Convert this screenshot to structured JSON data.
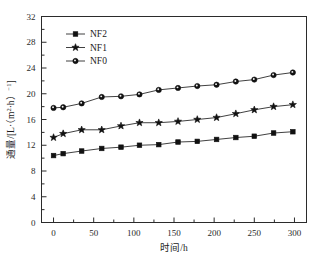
{
  "chart_data": {
    "type": "line",
    "title": "",
    "xlabel": "时间/h",
    "ylabel": "通量/[L·（m²·h）⁻¹]",
    "ylabel_parts": {
      "main": "通量",
      "slash": "/[L·（m",
      "sup1": "2",
      "mid": "·h）",
      "sup2": "−1",
      "end": "]"
    },
    "xlim": [
      -15,
      315
    ],
    "ylim": [
      0,
      32
    ],
    "xticks": [
      0,
      50,
      100,
      150,
      200,
      250,
      300
    ],
    "yticks": [
      0,
      4,
      8,
      12,
      16,
      20,
      24,
      28,
      32
    ],
    "xtick_labels": [
      "0",
      "50",
      "100",
      "150",
      "200",
      "250",
      "300"
    ],
    "ytick_labels": [
      "0",
      "4",
      "8",
      "12",
      "16",
      "20",
      "24",
      "28",
      "32"
    ],
    "minor_yticks": [
      2,
      6,
      10,
      14,
      18,
      22,
      26,
      30
    ],
    "grid": false,
    "legend_position": "upper-left-inside",
    "x": [
      0,
      12,
      35,
      60,
      84,
      107,
      131,
      155,
      179,
      203,
      227,
      250,
      274,
      298
    ],
    "series": [
      {
        "name": "NF2",
        "marker": "square",
        "values": [
          10.4,
          10.7,
          11.1,
          11.5,
          11.7,
          12.0,
          12.1,
          12.5,
          12.6,
          12.9,
          13.2,
          13.4,
          13.9,
          14.1
        ]
      },
      {
        "name": "NF1",
        "marker": "star",
        "values": [
          13.2,
          13.8,
          14.4,
          14.4,
          15.0,
          15.5,
          15.5,
          15.7,
          16.0,
          16.3,
          16.9,
          17.5,
          18.0,
          18.3
        ]
      },
      {
        "name": "NF0",
        "marker": "circle",
        "values": [
          17.8,
          17.9,
          18.5,
          19.5,
          19.6,
          19.9,
          20.6,
          20.9,
          21.2,
          21.4,
          21.9,
          22.2,
          22.9,
          23.3
        ]
      }
    ]
  },
  "legend": {
    "items": [
      {
        "label": "NF2",
        "marker": "square"
      },
      {
        "label": "NF1",
        "marker": "star"
      },
      {
        "label": "NF0",
        "marker": "circle"
      }
    ]
  },
  "colors": {
    "axis": "#2b2b2b",
    "line": "#2b2b2b",
    "marker": "#111111",
    "background": "#ffffff"
  }
}
